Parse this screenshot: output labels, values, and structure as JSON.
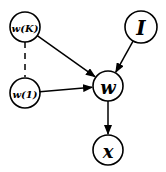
{
  "diagram": {
    "type": "graphical-model",
    "nodes": [
      {
        "id": "wK",
        "label": "w(K)",
        "cx": 25,
        "cy": 27,
        "r": 15,
        "font_size": 10
      },
      {
        "id": "w1",
        "label": "w(1)",
        "cx": 25,
        "cy": 93,
        "r": 15,
        "font_size": 10
      },
      {
        "id": "I",
        "label": "I",
        "cx": 141,
        "cy": 27,
        "r": 16,
        "font_size": 20
      },
      {
        "id": "w",
        "label": "w",
        "cx": 108,
        "cy": 86,
        "r": 15,
        "font_size": 18
      },
      {
        "id": "x",
        "label": "x",
        "cx": 108,
        "cy": 150,
        "r": 15,
        "font_size": 18
      }
    ],
    "edges": [
      {
        "from": "wK",
        "to": "w",
        "style": "arrow"
      },
      {
        "from": "w1",
        "to": "w",
        "style": "arrow"
      },
      {
        "from": "I",
        "to": "w",
        "style": "arrow"
      },
      {
        "from": "w",
        "to": "x",
        "style": "arrow"
      },
      {
        "from": "wK",
        "to": "w1",
        "style": "dashed"
      }
    ]
  }
}
